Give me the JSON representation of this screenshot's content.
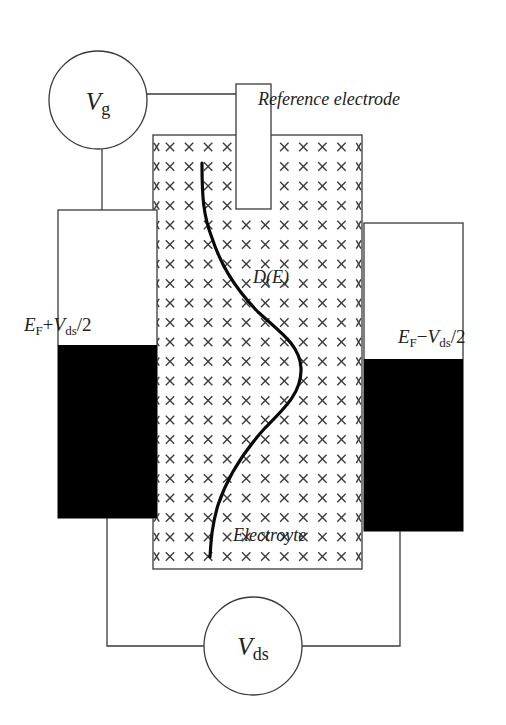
{
  "diagram": {
    "gate_meter": {
      "symbol": "V",
      "subscript": "g",
      "center": [
        98,
        100
      ],
      "radius": 49
    },
    "drain_source_meter": {
      "symbol": "V",
      "subscript": "ds",
      "center": [
        253,
        646
      ],
      "radius": 49
    },
    "reference_electrode": {
      "label": "Reference electrode",
      "box": [
        236,
        84,
        35,
        125
      ]
    },
    "electrolyte": {
      "label": "Electroyte",
      "box": [
        153,
        135,
        209,
        434
      ],
      "pattern": "x-marks",
      "grid": {
        "x0": 170,
        "dx": 19.05,
        "cols": 11,
        "y0": 147,
        "dy": 19.5,
        "rows": 22
      }
    },
    "left_electrode": {
      "box": [
        58,
        210,
        99,
        308
      ],
      "fill_level_y": 345,
      "label_prefix": "E",
      "label_prefix_sub": "F",
      "label_op": "+",
      "label_var": "V",
      "label_var_sub": "ds",
      "label_suffix": "/2"
    },
    "right_electrode": {
      "box": [
        364,
        223,
        99,
        308
      ],
      "fill_level_y": 359,
      "label_prefix": "E",
      "label_prefix_sub": "F",
      "label_op": "−",
      "label_var": "V",
      "label_var_sub": "ds",
      "label_suffix": "/2"
    },
    "dos_curve": {
      "label": "D(E)",
      "points": [
        [
          202,
          163
        ],
        [
          203,
          222
        ],
        [
          228,
          282
        ],
        [
          270,
          322
        ],
        [
          300,
          352
        ],
        [
          298,
          378
        ],
        [
          277,
          412
        ],
        [
          243,
          455
        ],
        [
          220,
          505
        ],
        [
          212,
          555
        ]
      ]
    },
    "colors": {
      "line": "#3a3a3a",
      "filled": "#000000",
      "background": "#ffffff"
    }
  }
}
